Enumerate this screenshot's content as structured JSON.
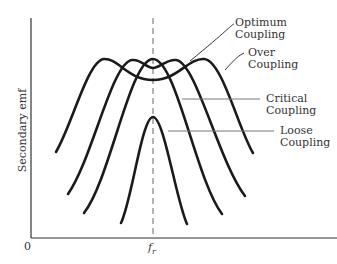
{
  "diagram": {
    "y_axis_label": "Secondary emf",
    "origin_label": "0",
    "x_marker_label": "f_r",
    "x_marker_display": "fr",
    "curves": [
      {
        "name": "Optimum Coupling",
        "line1": "Optimum",
        "line2": "Coupling"
      },
      {
        "name": "Over Coupling",
        "line1": "Over",
        "line2": "Coupling"
      },
      {
        "name": "Critical Coupling",
        "line1": "Critical",
        "line2": "Coupling"
      },
      {
        "name": "Loose Coupling",
        "line1": "Loose",
        "line2": "Coupling"
      }
    ]
  }
}
